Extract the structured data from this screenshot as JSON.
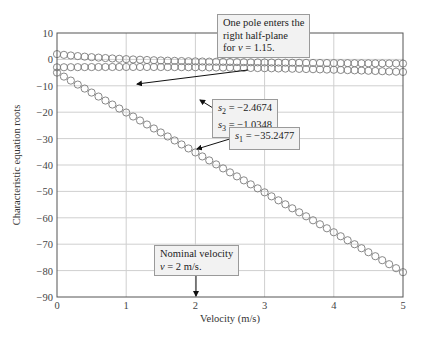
{
  "chart_data": {
    "type": "scatter",
    "title": "",
    "xlabel": "Velocity (m/s)",
    "ylabel": "Characteristic equation roots",
    "xlim": [
      0,
      5
    ],
    "ylim": [
      -90,
      10
    ],
    "xticks": [
      0,
      1,
      2,
      3,
      4,
      5
    ],
    "yticks": [
      10,
      0,
      -10,
      -20,
      -30,
      -40,
      -50,
      -60,
      -70,
      -80,
      -90
    ],
    "grid": true,
    "marker": "open-circle",
    "series": [
      {
        "name": "s3 branch (upper)",
        "x_start": 0,
        "x_end": 5,
        "y_start": 3.0,
        "y_at_1.15": 0,
        "y_at_2": -1.0348,
        "y_end": -1.5
      },
      {
        "name": "s2 branch (middle)",
        "x_start": 0,
        "x_end": 5,
        "y_start": -3.0,
        "y_at_2": -2.4674,
        "y_end": -4.5
      },
      {
        "name": "s1 branch (lower)",
        "x_start": 0,
        "x_end": 5,
        "y_start": -5.0,
        "y_at_2": -35.2477,
        "y_end": -82.0
      }
    ],
    "annotations": [
      {
        "text": "One pole enters the right half-plane for v = 1.15.",
        "x": 1.15,
        "y": 0
      },
      {
        "text": "s2 = -2.4674, s3 = -1.0348",
        "x": 2,
        "y": -2.5
      },
      {
        "text": "s1 = -35.2477",
        "x": 2,
        "y": -35.2477
      },
      {
        "text": "Nominal velocity v = 2 m/s.",
        "x": 2,
        "y": -90
      }
    ]
  },
  "labels": {
    "xlabel": "Velocity (m/s)",
    "ylabel": "Characteristic equation roots"
  },
  "notes": {
    "rhp_line1": "One pole enters the",
    "rhp_line2": "right half-plane",
    "rhp_line3_pre": "for ",
    "rhp_var": "v",
    "rhp_line3_post": " = 1.15.",
    "s2_var": "s",
    "s2_sub": "2",
    "s2_val": " = −2.4674",
    "s3_var": "s",
    "s3_sub": "3",
    "s3_val": " = −1.0348",
    "s1_var": "s",
    "s1_sub": "1",
    "s1_val": " = −35.2477",
    "nom_line1": "Nominal velocity",
    "nom_var": "v",
    "nom_line2_post": " = 2 m/s."
  }
}
